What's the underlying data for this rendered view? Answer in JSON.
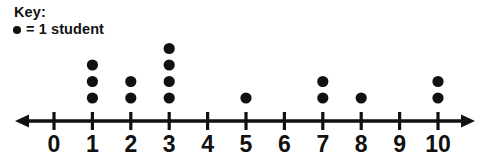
{
  "key": {
    "title": "Key:",
    "bullet_icon": "filled-circle-icon",
    "legend_text": "= 1 student"
  },
  "colors": {
    "ink": "#111111",
    "background": "#ffffff"
  },
  "axis": {
    "left_arrow_icon": "arrow-left-icon",
    "right_arrow_icon": "arrow-right-icon",
    "y": 121,
    "x_start": 15,
    "x_end": 475,
    "tick_origin_x": 54,
    "tick_spacing": 38.4,
    "tick_half_height": 9
  },
  "dots": {
    "radius": 5.6,
    "baseline_y": 98,
    "row_spacing": 16.5
  },
  "chart_data": {
    "type": "scatter",
    "title": "",
    "subtitle": "",
    "xlabel": "",
    "ylabel": "",
    "legend": [
      "= 1 student"
    ],
    "annotations": [
      "Key:",
      "= 1 student"
    ],
    "grid": false,
    "legend_position": "top-left",
    "xlim": [
      0,
      10
    ],
    "xticks": [
      0,
      1,
      2,
      3,
      4,
      5,
      6,
      7,
      8,
      9,
      10
    ],
    "categories": [
      "0",
      "1",
      "2",
      "3",
      "4",
      "5",
      "6",
      "7",
      "8",
      "9",
      "10"
    ],
    "values": [
      0,
      3,
      2,
      4,
      0,
      1,
      0,
      2,
      1,
      0,
      2
    ],
    "total_dots": 15,
    "dot_unit": 1,
    "dot_unit_label": "1 student"
  }
}
